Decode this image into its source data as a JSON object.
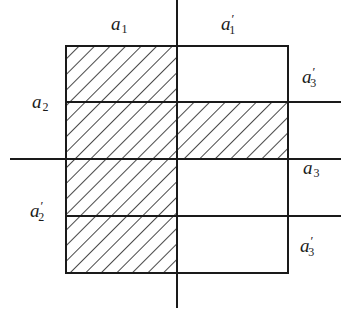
{
  "diagram": {
    "type": "set-partition-venn-grid",
    "colors": {
      "line": "#1a1a1a",
      "hatch": "#1a1a1a",
      "background": "#ffffff"
    },
    "labels": {
      "top_left": {
        "base": "a",
        "sub": "1",
        "prime": ""
      },
      "top_right": {
        "base": "a",
        "sub": "1",
        "prime": "′"
      },
      "left_upper": {
        "base": "a",
        "sub": "2",
        "prime": ""
      },
      "left_lower": {
        "base": "a",
        "sub": "2",
        "prime": "′"
      },
      "right_top": {
        "base": "a",
        "sub": "3",
        "prime": "′"
      },
      "right_mid": {
        "base": "a",
        "sub": "3",
        "prime": ""
      },
      "right_bottom": {
        "base": "a",
        "sub": "3",
        "prime": "′"
      }
    },
    "regions": [
      {
        "name": "a1-column",
        "hatched": true
      },
      {
        "name": "a1'-a3'-top",
        "hatched": false
      },
      {
        "name": "a1'-a2-a3",
        "hatched": true
      },
      {
        "name": "a1'-a3-lower",
        "hatched": false
      },
      {
        "name": "a1'-a3'-bottom",
        "hatched": false
      }
    ]
  }
}
